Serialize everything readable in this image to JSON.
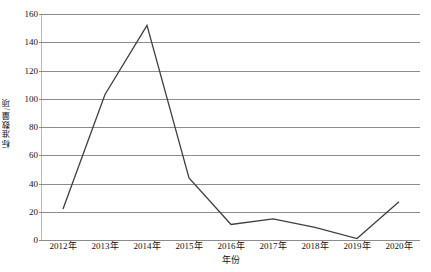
{
  "chart_data": {
    "type": "line",
    "title": "",
    "xlabel": "年份",
    "ylabel": "标准数量/项",
    "categories": [
      "2012年",
      "2013年",
      "2014年",
      "2015年",
      "2016年",
      "2017年",
      "2018年",
      "2019年",
      "2020年"
    ],
    "values": [
      22,
      103,
      152,
      44,
      11,
      15,
      9,
      1,
      27
    ],
    "series": [
      {
        "name": "标准数量",
        "values": [
          22,
          103,
          152,
          44,
          11,
          15,
          9,
          1,
          27
        ]
      }
    ],
    "ylim": [
      0,
      160
    ],
    "yticks": [
      0,
      20,
      40,
      60,
      80,
      100,
      120,
      140,
      160
    ],
    "ytick_labels": [
      "0",
      "20",
      "40",
      "60",
      "80",
      "100",
      "120",
      "140",
      "160"
    ],
    "grid": true,
    "grid_axis": "y",
    "legend": false,
    "legend_position": "none",
    "markers": false,
    "line_color": "#3f3f3f",
    "grid_color": "#8c8c8c",
    "background_color": "#ffffff",
    "annotations": []
  }
}
